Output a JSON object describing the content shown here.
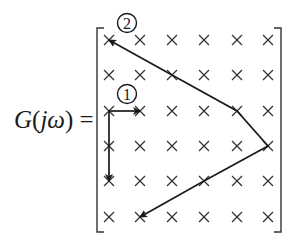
{
  "equation": {
    "function_name": "G",
    "open_paren": "(",
    "argument": "jω",
    "close_paren": ")",
    "equals": "="
  },
  "matrix": {
    "rows": 6,
    "cols": 6,
    "entry_symbol": "×",
    "column_x": [
      109,
      140,
      172,
      204,
      237,
      268
    ],
    "row_y": [
      40,
      75,
      111,
      146,
      181,
      217
    ]
  },
  "paths": [
    {
      "label": "1",
      "badge_position": {
        "x": 127,
        "y": 94
      },
      "segments": [
        {
          "from": [
            2,
            0
          ],
          "to": [
            2,
            1
          ],
          "arrow_at_end": true
        },
        {
          "from": [
            2,
            0
          ],
          "to": [
            4,
            0
          ],
          "arrow_at_end": true
        }
      ]
    },
    {
      "label": "2",
      "badge_position": {
        "x": 127,
        "y": 23
      },
      "points": [
        [
          0,
          0
        ],
        [
          1,
          2
        ],
        [
          2,
          4
        ],
        [
          3,
          5
        ],
        [
          4,
          3
        ],
        [
          5,
          1
        ]
      ],
      "arrow_at_start": true,
      "arrow_at_end": true
    }
  ],
  "colors": {
    "ink": "#1a1a1a",
    "background": "#ffffff"
  }
}
